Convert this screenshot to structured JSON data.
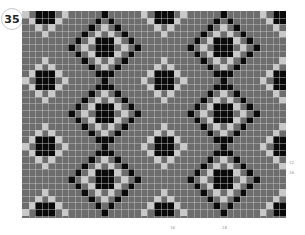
{
  "badge": {
    "number": "35"
  },
  "chart": {
    "cols": 40,
    "rows": 31,
    "cell_px": 6.6,
    "colors": {
      "background": "#6d6d6d",
      "dark": "#0a0a0a",
      "light": "#c9c9c9"
    },
    "large_diamond": {
      "dark": [
        [
          0,
          -5
        ],
        [
          -1,
          -4
        ],
        [
          1,
          -4
        ],
        [
          -2,
          -3
        ],
        [
          2,
          -3
        ],
        [
          -3,
          -2
        ],
        [
          3,
          -2
        ],
        [
          -4,
          -1
        ],
        [
          4,
          -1
        ],
        [
          -5,
          0
        ],
        [
          5,
          0
        ],
        [
          -4,
          1
        ],
        [
          4,
          1
        ],
        [
          -3,
          2
        ],
        [
          3,
          2
        ],
        [
          -2,
          3
        ],
        [
          2,
          3
        ],
        [
          -1,
          4
        ],
        [
          1,
          4
        ],
        [
          0,
          5
        ],
        [
          0,
          -1
        ],
        [
          -1,
          0
        ],
        [
          0,
          0
        ],
        [
          1,
          0
        ],
        [
          0,
          1
        ],
        [
          -1,
          -1
        ],
        [
          1,
          -1
        ],
        [
          -1,
          1
        ],
        [
          1,
          1
        ],
        [
          0,
          6
        ],
        [
          0,
          -6
        ]
      ],
      "light": [
        [
          0,
          -3
        ],
        [
          -1,
          -2
        ],
        [
          1,
          -2
        ],
        [
          -2,
          -1
        ],
        [
          2,
          -1
        ],
        [
          -3,
          0
        ],
        [
          3,
          0
        ],
        [
          -2,
          1
        ],
        [
          2,
          1
        ],
        [
          -1,
          2
        ],
        [
          1,
          2
        ],
        [
          0,
          3
        ]
      ]
    },
    "small_diamond": {
      "dark": [
        [
          0,
          -1
        ],
        [
          -1,
          0
        ],
        [
          0,
          0
        ],
        [
          1,
          0
        ],
        [
          0,
          1
        ],
        [
          -1,
          -1
        ],
        [
          1,
          -1
        ],
        [
          -1,
          1
        ],
        [
          1,
          1
        ]
      ],
      "light": [
        [
          0,
          -3
        ],
        [
          -1,
          -2
        ],
        [
          1,
          -2
        ],
        [
          -2,
          -1
        ],
        [
          2,
          -1
        ],
        [
          -3,
          0
        ],
        [
          3,
          0
        ],
        [
          -2,
          1
        ],
        [
          2,
          1
        ],
        [
          -1,
          2
        ],
        [
          1,
          2
        ],
        [
          0,
          3
        ]
      ]
    },
    "large_positions": [
      [
        12,
        5
      ],
      [
        30,
        5
      ],
      [
        12,
        15
      ],
      [
        30,
        15
      ],
      [
        12,
        25
      ],
      [
        30,
        25
      ]
    ],
    "small_positions": [
      [
        3,
        0
      ],
      [
        21,
        0
      ],
      [
        39,
        0
      ],
      [
        3,
        10
      ],
      [
        21,
        10
      ],
      [
        39,
        10
      ],
      [
        3,
        20
      ],
      [
        21,
        20
      ],
      [
        39,
        20
      ],
      [
        3,
        30
      ],
      [
        21,
        30
      ],
      [
        39,
        30
      ]
    ]
  },
  "labels": {
    "right": [
      {
        "text": "12",
        "x": 289,
        "y": 160
      },
      {
        "text": "16",
        "x": 289,
        "y": 170
      }
    ],
    "bottom": [
      {
        "text": "16",
        "x": 170,
        "y": 225
      },
      {
        "text": "18",
        "x": 222,
        "y": 225
      }
    ]
  }
}
